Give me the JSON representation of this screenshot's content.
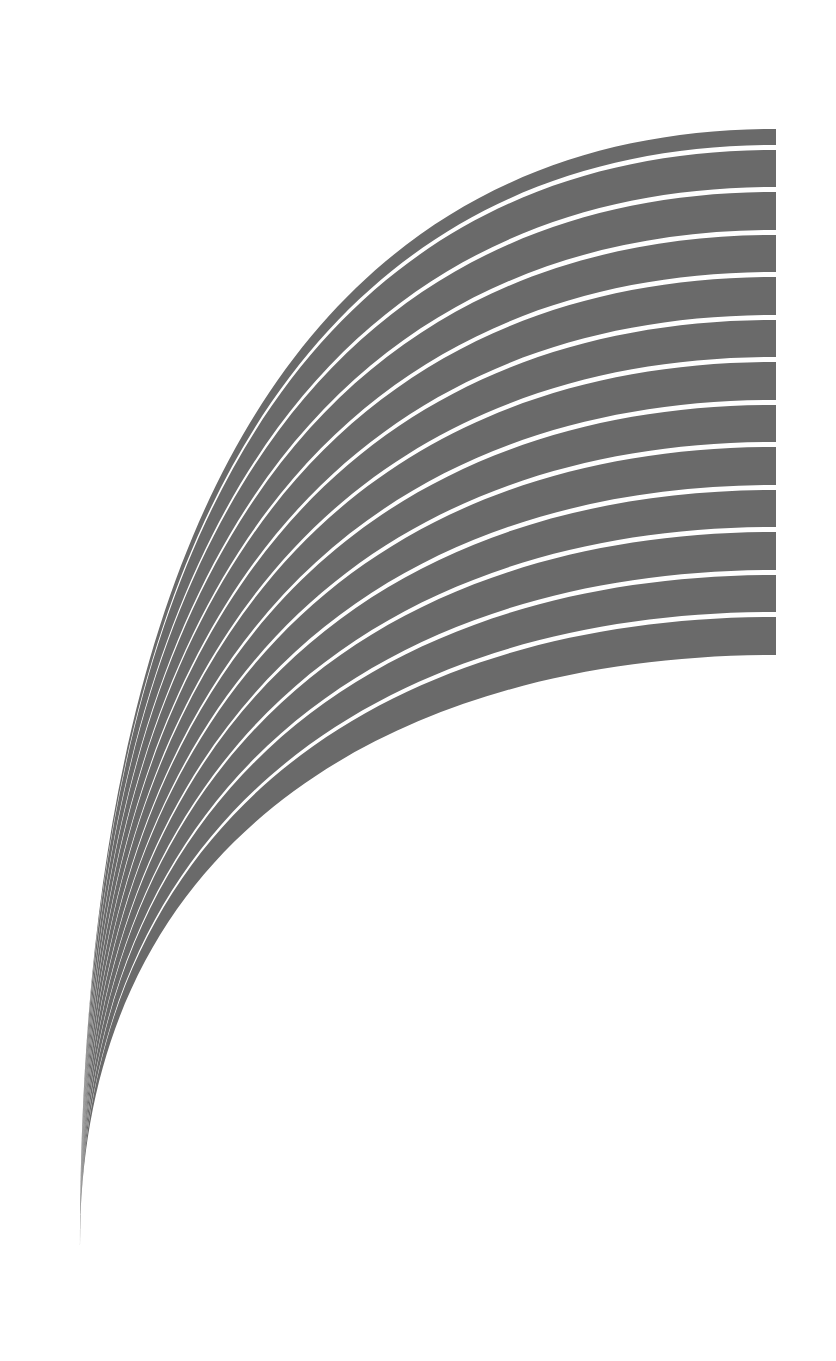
{
  "canvas": {
    "width": 836,
    "height": 1361,
    "background": "#ffffff"
  },
  "artwork": {
    "description": "Fan of curved gray stripes separated by thin white gaps, converging to a point at bottom-left",
    "band_color": "#6a6a6a",
    "gap_color": "#ffffff",
    "band_count": 13,
    "outer_curve": {
      "p0": [
        776,
        129
      ],
      "c1": [
        380,
        129
      ],
      "c2": [
        80,
        420
      ],
      "p3": [
        80,
        1245
      ]
    },
    "inner_curve": {
      "p0": [
        776,
        655
      ],
      "c1": [
        420,
        655
      ],
      "c2": [
        80,
        820
      ],
      "p3": [
        80,
        1245
      ]
    },
    "right_edge_x": 776,
    "bands_right_edge_y": [
      [
        129,
        145
      ],
      [
        150,
        187
      ],
      [
        192,
        230
      ],
      [
        235,
        272
      ],
      [
        277,
        315
      ],
      [
        320,
        357
      ],
      [
        362,
        400
      ],
      [
        405,
        442
      ],
      [
        447,
        485
      ],
      [
        490,
        527
      ],
      [
        532,
        570
      ],
      [
        575,
        612
      ],
      [
        617,
        655
      ]
    ]
  }
}
